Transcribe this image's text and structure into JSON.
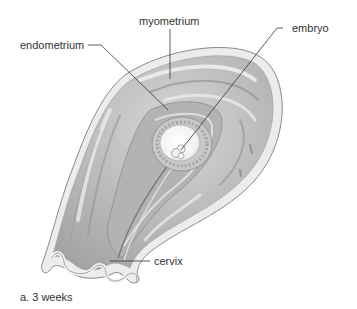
{
  "figure": {
    "caption": "a. 3 weeks",
    "labels": {
      "myometrium": "myometrium",
      "endometrium": "endometrium",
      "embryo": "embryo",
      "cervix": "cervix"
    }
  },
  "colors": {
    "background": "#ffffff",
    "tissue_dark": "#9a9a9a",
    "tissue_mid": "#c4c4c4",
    "tissue_light": "#e6e6e6",
    "outline": "#8a8a8a",
    "leader_line": "#333333",
    "text": "#333333"
  }
}
